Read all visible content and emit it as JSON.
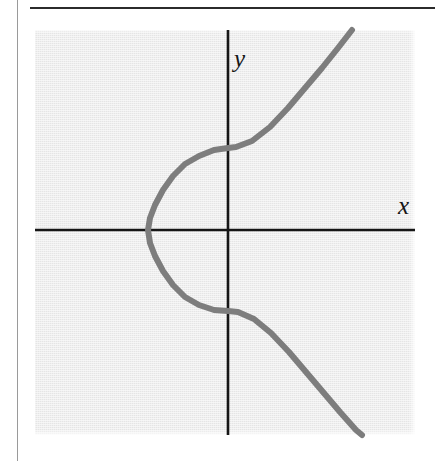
{
  "page": {
    "background_color": "#ffffff",
    "width": 441,
    "height": 461
  },
  "rules": {
    "margin_rule_color": "#9a9a9a",
    "top_rule_color": "#2b2b2b"
  },
  "figure": {
    "panel_color": "#ebebeb",
    "axis_color": "#161616",
    "curve_color": "#7d7d7d",
    "y_axis_label": "y",
    "x_axis_label": "x"
  },
  "chart_data": {
    "type": "line",
    "title": "",
    "subtitle": "",
    "xlabel": "x",
    "ylabel": "y",
    "grid": false,
    "legend": null,
    "axes": {
      "x_axis_pixel_y": 230,
      "y_axis_pixel_x": 228,
      "origin": [
        0,
        0
      ],
      "show_ticks": false,
      "show_tick_labels": false
    },
    "relation": "x = y^3 - 3y",
    "series": [
      {
        "name": "cubic-curve",
        "orientation": "x-as-function-of-y",
        "color": "#7d7d7d",
        "stroke_width": 6,
        "points_pixel": [
          [
            352,
            30
          ],
          [
            338,
            48
          ],
          [
            322,
            68
          ],
          [
            305,
            88
          ],
          [
            288,
            108
          ],
          [
            270,
            127
          ],
          [
            252,
            141
          ],
          [
            236,
            147
          ],
          [
            228,
            148
          ],
          [
            214,
            150
          ],
          [
            199,
            156
          ],
          [
            185,
            164
          ],
          [
            173,
            176
          ],
          [
            163,
            190
          ],
          [
            155,
            205
          ],
          [
            150,
            218
          ],
          [
            148,
            230
          ],
          [
            150,
            243
          ],
          [
            155,
            256
          ],
          [
            163,
            271
          ],
          [
            173,
            285
          ],
          [
            185,
            297
          ],
          [
            199,
            305
          ],
          [
            214,
            310
          ],
          [
            228,
            311
          ],
          [
            238,
            312
          ],
          [
            254,
            319
          ],
          [
            271,
            333
          ],
          [
            289,
            352
          ],
          [
            306,
            372
          ],
          [
            323,
            392
          ],
          [
            340,
            412
          ],
          [
            356,
            430
          ],
          [
            362,
            435
          ]
        ],
        "key_features": {
          "y_axis_crossings_pixel_y": [
            148,
            311
          ],
          "leftmost_point_pixel": [
            148,
            230
          ],
          "enters_top_at_pixel_x": 352,
          "exits_bottom_at_pixel_x": 362
        }
      }
    ]
  }
}
